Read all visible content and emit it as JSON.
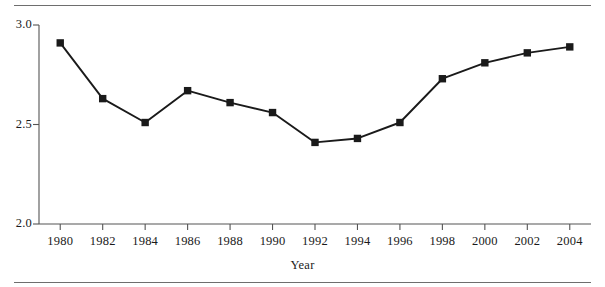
{
  "chart_data": {
    "type": "line",
    "title": "",
    "xlabel": "Year",
    "ylabel": "",
    "x": [
      1980,
      1982,
      1984,
      1986,
      1988,
      1990,
      1992,
      1994,
      1996,
      1998,
      2000,
      2002,
      2004
    ],
    "values": [
      2.91,
      2.63,
      2.51,
      2.67,
      2.61,
      2.56,
      2.41,
      2.43,
      2.51,
      2.73,
      2.81,
      2.86,
      2.89
    ],
    "categories": [
      "1980",
      "1982",
      "1984",
      "1986",
      "1988",
      "1990",
      "1992",
      "1994",
      "1996",
      "1998",
      "2000",
      "2002",
      "2004"
    ],
    "xlim": [
      1979,
      2005
    ],
    "ylim": [
      2.0,
      3.0
    ],
    "ytick_labels": [
      "2.0",
      "2.5",
      "3.0"
    ],
    "yticks": [
      2.0,
      2.5,
      3.0
    ],
    "xtick_labels": [
      "1980",
      "1982",
      "1984",
      "1986",
      "1988",
      "1990",
      "1992",
      "1994",
      "1996",
      "1998",
      "2000",
      "2002",
      "2004"
    ],
    "grid": false,
    "legend": null,
    "marker": "square",
    "series_color": "#1a1a1a",
    "axis_color": "#555555",
    "rule_color": "#6e6e6e"
  }
}
